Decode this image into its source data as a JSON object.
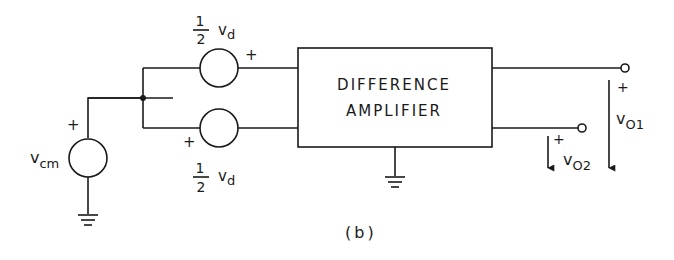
{
  "diagram": {
    "caption": "(b)",
    "amplifier": {
      "line1": "DIFFERENCE",
      "line2": "AMPLIFIER"
    },
    "sources": {
      "top": {
        "frac_num": "1",
        "frac_den": "2",
        "symbol": "v",
        "sub": "d",
        "polarity": "+"
      },
      "bottom": {
        "frac_num": "1",
        "frac_den": "2",
        "symbol": "v",
        "sub": "d",
        "polarity": "+"
      },
      "common_mode": {
        "symbol": "v",
        "sub": "cm",
        "polarity": "+"
      }
    },
    "outputs": {
      "o1": {
        "symbol": "v",
        "sub": "O1",
        "polarity": "+"
      },
      "o2": {
        "symbol": "v",
        "sub": "O2",
        "polarity": "+"
      }
    }
  }
}
